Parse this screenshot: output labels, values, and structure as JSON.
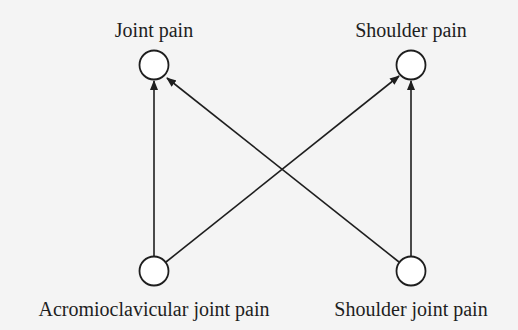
{
  "diagram": {
    "type": "directed-graph",
    "colors": {
      "background": "#f4f4f4",
      "stroke": "#1e1e1e",
      "node_fill": "#ffffff"
    },
    "nodes": [
      {
        "id": "joint_pain",
        "label": "Joint pain"
      },
      {
        "id": "shoulder_pain",
        "label": "Shoulder pain"
      },
      {
        "id": "ac_joint_pain",
        "label": "Acromioclavicular joint pain"
      },
      {
        "id": "shoulder_joint_pain",
        "label": "Shoulder joint pain"
      }
    ],
    "edges": [
      {
        "from": "ac_joint_pain",
        "to": "joint_pain"
      },
      {
        "from": "ac_joint_pain",
        "to": "shoulder_pain"
      },
      {
        "from": "shoulder_joint_pain",
        "to": "joint_pain"
      },
      {
        "from": "shoulder_joint_pain",
        "to": "shoulder_pain"
      }
    ]
  }
}
